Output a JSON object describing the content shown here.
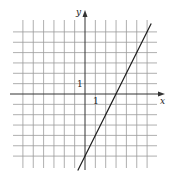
{
  "chart_data": {
    "type": "line",
    "title": "",
    "xlabel": "x",
    "ylabel": "y",
    "tick_labels": {
      "x": "1",
      "y": "1"
    },
    "grid": true,
    "xlim": [
      -6,
      6
    ],
    "ylim": [
      -6,
      6
    ],
    "series": [
      {
        "name": "y = 2x - 6",
        "x": [
          0,
          3,
          6.4
        ],
        "y": [
          -6,
          0,
          6.8
        ],
        "slope": 2,
        "x_intercept": 3,
        "y_intercept": -6
      }
    ]
  },
  "labels": {
    "x_axis": "x",
    "y_axis": "y",
    "x_tick": "1",
    "y_tick": "1"
  },
  "colors": {
    "grid": "#9a9a9a",
    "axis": "#333333",
    "line": "#1a1a1a"
  }
}
